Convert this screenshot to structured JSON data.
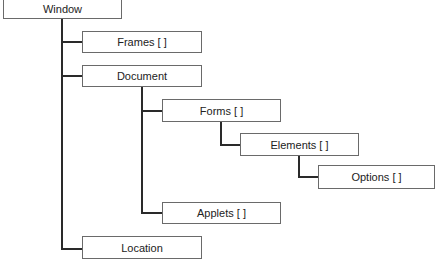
{
  "diagram": {
    "title": "",
    "type": "hierarchy-tree",
    "nodes": [
      {
        "id": "window",
        "label": "Window",
        "parent": null
      },
      {
        "id": "frames",
        "label": "Frames [ ]",
        "parent": "window"
      },
      {
        "id": "document",
        "label": "Document",
        "parent": "window"
      },
      {
        "id": "forms",
        "label": "Forms [ ]",
        "parent": "document"
      },
      {
        "id": "elements",
        "label": "Elements [ ]",
        "parent": "forms"
      },
      {
        "id": "options",
        "label": "Options [ ]",
        "parent": "elements"
      },
      {
        "id": "applets",
        "label": "Applets [ ]",
        "parent": "document"
      },
      {
        "id": "location",
        "label": "Location",
        "parent": "window"
      }
    ]
  }
}
